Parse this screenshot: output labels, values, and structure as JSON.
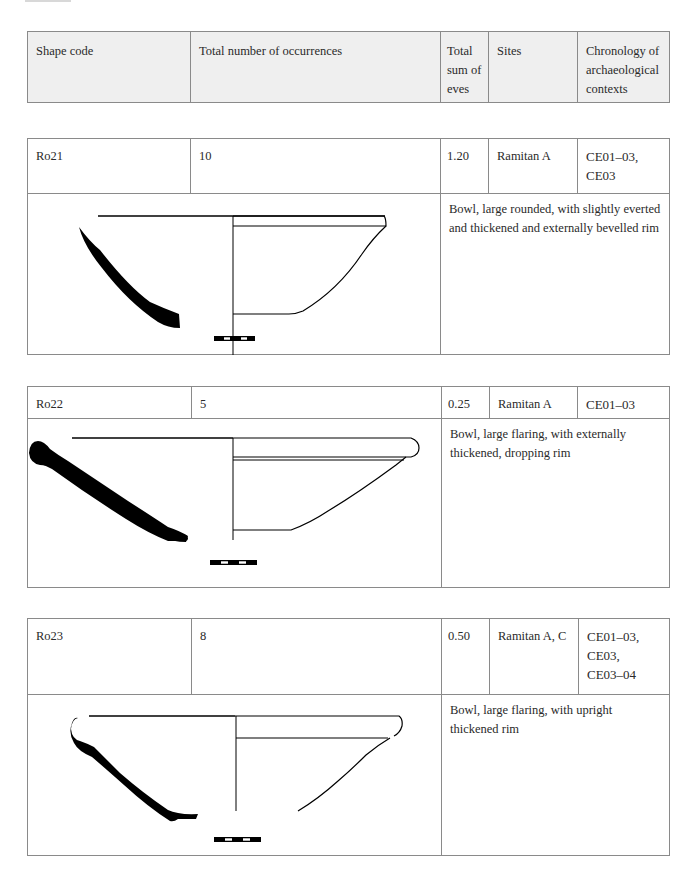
{
  "header": {
    "shape_code": "Shape code",
    "total_occurrences": "Total number of occurrences",
    "total_eves": "Total sum of eves",
    "sites": "Sites",
    "chronology": "Chronology of archaeological contexts"
  },
  "entries": [
    {
      "shape_code": "R021",
      "shape_code_display": "Ro21",
      "occurrences": "10",
      "eves": "1.20",
      "sites": "Ramitan A",
      "chronology": [
        "CE01–03,",
        "CE03"
      ],
      "description": "Bowl, large rounded, with slightly everted and thickened and externally bevelled rim",
      "drawing": "bowl-profile-rounded-bevelled-rim"
    },
    {
      "shape_code": "R022",
      "shape_code_display": "Ro22",
      "occurrences": "5",
      "eves": "0.25",
      "sites": "Ramitan A",
      "chronology": [
        "CE01–03"
      ],
      "description": "Bowl, large flaring, with externally thickened, dropping rim",
      "drawing": "bowl-profile-flaring-dropping-rim"
    },
    {
      "shape_code": "R023",
      "shape_code_display": "Ro23",
      "occurrences": "8",
      "eves": "0.50",
      "sites": "Ramitan A, C",
      "chronology": [
        "CE01–03,",
        "CE03,",
        "CE03–04"
      ],
      "description": "Bowl, large flaring, with upright thickened rim",
      "drawing": "bowl-profile-flaring-upright-rim"
    }
  ]
}
